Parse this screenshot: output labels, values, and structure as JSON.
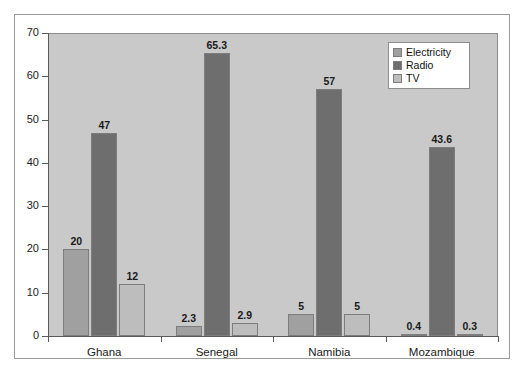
{
  "chart_data": {
    "type": "bar",
    "title": "",
    "subtitle": "",
    "xlabel": "",
    "ylabel": "",
    "categories": [
      "Ghana",
      "Senegal",
      "Namibia",
      "Mozambique"
    ],
    "series": [
      {
        "name": "Electricity",
        "color": "#a0a0a0",
        "values": [
          20,
          2.3,
          5,
          0.4
        ],
        "labels": [
          "20",
          "2.3",
          "5",
          "0.4"
        ]
      },
      {
        "name": "Radio",
        "color": "#6e6e6e",
        "values": [
          47,
          65.3,
          57,
          43.6
        ],
        "labels": [
          "47",
          "65.3",
          "57",
          "43.6"
        ]
      },
      {
        "name": "TV",
        "color": "#bdbdbd",
        "values": [
          12,
          2.9,
          5,
          0.3
        ],
        "labels": [
          "12",
          "2.9",
          "5",
          "0.3"
        ]
      }
    ],
    "ylim": [
      0,
      70
    ],
    "yticks": [
      0,
      10,
      20,
      30,
      40,
      50,
      60,
      70
    ],
    "ytick_labels": [
      "0",
      "10",
      "20",
      "30",
      "40",
      "50",
      "60",
      "70"
    ],
    "grid": false,
    "legend_position": "top-right",
    "plot_background": "#c9c9c9",
    "data_labels_shown": true
  }
}
